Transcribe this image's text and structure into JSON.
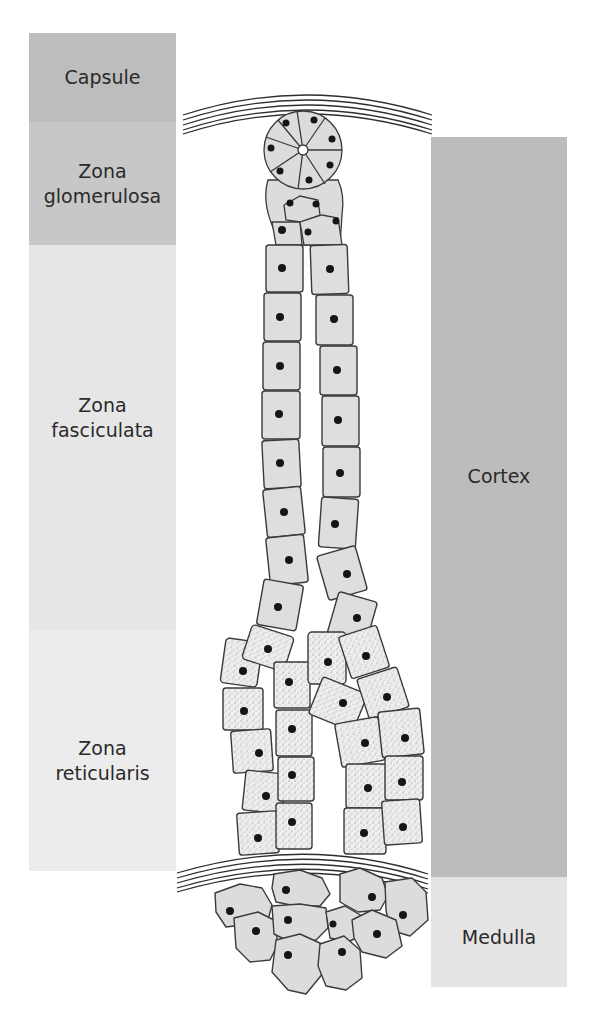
{
  "figure": {
    "left_labels": [
      {
        "id": "capsule",
        "label": "Capsule",
        "top": 33,
        "height": 89,
        "color": "#bdbdbd"
      },
      {
        "id": "zona-glomerulosa",
        "label": "Zona\nglomerulosa",
        "top": 122,
        "height": 123,
        "color": "#c6c6c6"
      },
      {
        "id": "zona-fasciculata",
        "label": "Zona\nfasciculata",
        "top": 245,
        "height": 385,
        "color": "#e6e6e6"
      },
      {
        "id": "zona-reticularis",
        "label": "Zona\nreticularis",
        "top": 630,
        "height": 241,
        "color": "#ececec"
      }
    ],
    "right_labels": [
      {
        "id": "cortex",
        "label": "Cortex",
        "top": 137,
        "height": 740,
        "color": "#bcbcbc"
      },
      {
        "id": "medulla",
        "label": "Medulla",
        "top": 877,
        "height": 110,
        "color": "#e4e4e4"
      }
    ],
    "colors": {
      "cell_fill": "#dcdcdc",
      "cell_outline": "#3a3a3a",
      "nucleus": "#151515",
      "capsule_lines": "#2e2e2e"
    }
  }
}
